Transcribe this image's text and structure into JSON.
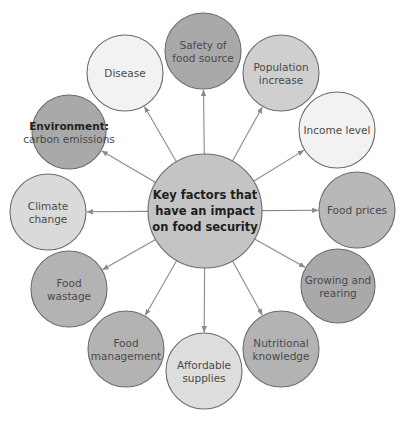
{
  "center": {
    "lines": [
      "Key factors that",
      "have an impact",
      "on food security"
    ],
    "x": 205,
    "y": 211,
    "r": 57,
    "fill": "#c4c4c4"
  },
  "colors": {
    "stroke": "#6a6a6a",
    "arrow": "#8a8a8a",
    "text": "#4a4a4a"
  },
  "nodes": [
    {
      "id": "safety-of-food-source",
      "lines": [
        "Safety of",
        "food source"
      ],
      "x": 203,
      "y": 51,
      "r": 38,
      "fill": "#a9a9a9"
    },
    {
      "id": "population-increase",
      "lines": [
        "Population",
        "increase"
      ],
      "x": 281,
      "y": 73,
      "r": 38,
      "fill": "#cfcfcf"
    },
    {
      "id": "income-level",
      "lines": [
        "Income level"
      ],
      "x": 337,
      "y": 130,
      "r": 38,
      "fill": "#f2f2f2"
    },
    {
      "id": "food-prices",
      "lines": [
        "Food prices"
      ],
      "x": 357,
      "y": 210,
      "r": 38,
      "fill": "#b8b8b8"
    },
    {
      "id": "growing-and-rearing",
      "lines": [
        "Growing and",
        "rearing"
      ],
      "x": 338,
      "y": 286,
      "r": 37,
      "fill": "#a9a9a9"
    },
    {
      "id": "nutritional-knowledge",
      "lines": [
        "Nutritional",
        "knowledge"
      ],
      "x": 281,
      "y": 349,
      "r": 38,
      "fill": "#b3b3b3"
    },
    {
      "id": "affordable-supplies",
      "lines": [
        "Affordable",
        "supplies"
      ],
      "x": 204,
      "y": 371,
      "r": 38,
      "fill": "#dedede"
    },
    {
      "id": "food-management",
      "lines": [
        "Food",
        "management"
      ],
      "x": 126,
      "y": 349,
      "r": 38,
      "fill": "#b3b3b3"
    },
    {
      "id": "food-wastage",
      "lines": [
        "Food",
        "wastage"
      ],
      "x": 69,
      "y": 289,
      "r": 38,
      "fill": "#b3b3b3"
    },
    {
      "id": "climate-change",
      "lines": [
        "Climate",
        "change"
      ],
      "x": 48,
      "y": 212,
      "r": 38,
      "fill": "#dadada"
    },
    {
      "id": "environment-carbon-emissions",
      "lines": [
        "Environment:",
        "carbon emissions"
      ],
      "bold_first": true,
      "x": 69,
      "y": 132,
      "r": 37,
      "fill": "#a9a9a9"
    },
    {
      "id": "disease",
      "lines": [
        "Disease"
      ],
      "x": 125,
      "y": 73,
      "r": 38,
      "fill": "#f2f2f2"
    }
  ]
}
